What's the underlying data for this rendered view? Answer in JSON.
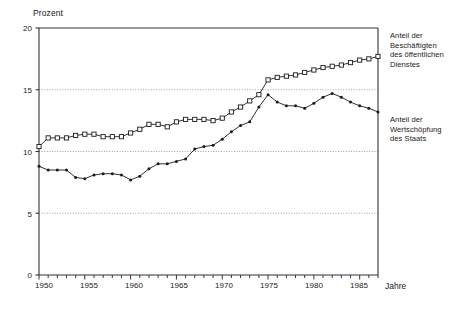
{
  "chart_data": {
    "type": "line",
    "title": "",
    "ylabel": "Prozent",
    "xlabel": "Jahre",
    "ylim": [
      0,
      20
    ],
    "yticks": [
      0,
      5,
      10,
      15,
      20
    ],
    "ytick_labels": [
      "0",
      "5",
      "10",
      "15",
      "20"
    ],
    "grid": "horizontal dotted at 5, 10, 15",
    "xlim": [
      1950,
      1987
    ],
    "xticks_minor_every": 1,
    "xtick_labels": [
      "1950",
      "1955",
      "1960",
      "1965",
      "1970",
      "1975",
      "1980",
      "1985"
    ],
    "xtick_label_years": [
      1950,
      1955,
      1960,
      1965,
      1970,
      1975,
      1980,
      1985
    ],
    "legend_position": "right",
    "x": [
      1950,
      1951,
      1952,
      1953,
      1954,
      1955,
      1956,
      1957,
      1958,
      1959,
      1960,
      1961,
      1962,
      1963,
      1964,
      1965,
      1966,
      1967,
      1968,
      1969,
      1970,
      1971,
      1972,
      1973,
      1974,
      1975,
      1976,
      1977,
      1978,
      1979,
      1980,
      1981,
      1982,
      1983,
      1984,
      1985,
      1986,
      1987
    ],
    "series": [
      {
        "name": "Anteil der Beschäftigten des öffentlichen Dienstes",
        "marker": "open-square",
        "color": "#1a1a1a",
        "values": [
          10.4,
          11.1,
          11.1,
          11.1,
          11.3,
          11.4,
          11.4,
          11.2,
          11.2,
          11.2,
          11.5,
          11.8,
          12.2,
          12.2,
          12.0,
          12.4,
          12.6,
          12.6,
          12.6,
          12.5,
          12.7,
          13.2,
          13.6,
          14.1,
          14.6,
          15.8,
          16.0,
          16.1,
          16.2,
          16.4,
          16.6,
          16.8,
          16.9,
          17.0,
          17.2,
          17.4,
          17.5,
          17.7
        ]
      },
      {
        "name": "Anteil der Wertschöpfung des Staats",
        "marker": "filled-dot",
        "color": "#1a1a1a",
        "values": [
          8.8,
          8.5,
          8.5,
          8.5,
          7.9,
          7.8,
          8.1,
          8.2,
          8.2,
          8.1,
          7.7,
          8.0,
          8.6,
          9.0,
          9.0,
          9.2,
          9.4,
          10.2,
          10.4,
          10.5,
          11.0,
          11.6,
          12.1,
          12.4,
          13.6,
          14.6,
          14.0,
          13.7,
          13.7,
          13.5,
          13.9,
          14.4,
          14.7,
          14.4,
          14.0,
          13.7,
          13.5,
          13.2
        ]
      }
    ]
  },
  "legend": {
    "items": [
      "Anteil der\nBeschäftigten\ndes öffentlichen\nDienstes",
      "Anteil der\nWertschöpfung\ndes Staats"
    ]
  },
  "colors": {
    "line": "#1a1a1a",
    "axis": "#333333",
    "grid": "#8a8a8a",
    "background": "#ffffff"
  }
}
